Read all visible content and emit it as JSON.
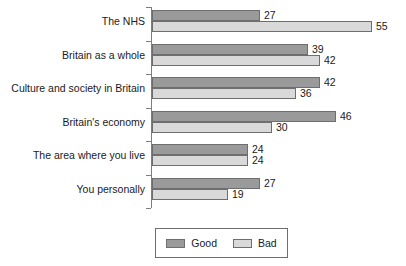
{
  "chart_data": {
    "type": "bar",
    "orientation": "horizontal",
    "title": "",
    "subtitle": "",
    "xlabel": "",
    "ylabel": "",
    "categories": [
      "The NHS",
      "Britain as a whole",
      "Culture and society in Britain",
      "Britain's economy",
      "The area where you live",
      "You personally"
    ],
    "series": [
      {
        "name": "Good",
        "color": "#9a9a9a",
        "values": [
          27,
          39,
          42,
          46,
          24,
          27
        ]
      },
      {
        "name": "Bad",
        "color": "#d9d9d9",
        "values": [
          55,
          42,
          36,
          30,
          24,
          19
        ]
      }
    ],
    "data_labels": true,
    "xlim": [
      0,
      55
    ],
    "grid": false,
    "legend": {
      "position": "bottom",
      "entries": [
        "Good",
        "Bad"
      ]
    },
    "axis": {
      "category_axis_visible": true,
      "value_axis_visible": false,
      "tick_labels": []
    }
  }
}
